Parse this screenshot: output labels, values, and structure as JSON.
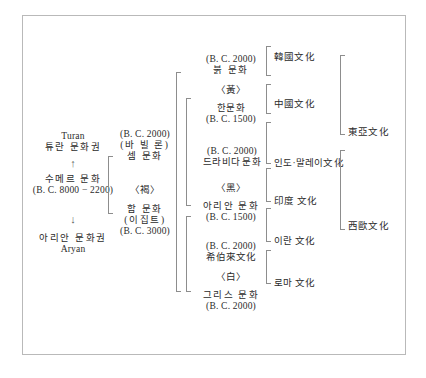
{
  "diagram": {
    "frame_color": "#b9b9b9",
    "text_color": "#2b2b2b",
    "columns": [
      {
        "id": "col1",
        "name": "origin-column",
        "nodes": [
          {
            "id": "turan",
            "lines": [
              "Turan",
              "튜란 문화권"
            ]
          },
          {
            "id": "arrow-up",
            "lines": [
              "↑"
            ]
          },
          {
            "id": "sumer",
            "lines": [
              "수메르 문화",
              "(B. C. 8000 − 2200)"
            ]
          },
          {
            "id": "arrow-down",
            "lines": [
              "↓"
            ]
          },
          {
            "id": "aryan",
            "lines": [
              "아리안 문화권",
              "Aryan"
            ]
          }
        ]
      },
      {
        "id": "col2",
        "name": "semitic-hamitic-column",
        "nodes": [
          {
            "id": "sem",
            "lines": [
              "(B. C. 2000)",
              "(바 빌 론)",
              "셈 문화"
            ]
          },
          {
            "id": "brown",
            "lines": [
              "〈褐〉"
            ]
          },
          {
            "id": "ham",
            "lines": [
              "함 문화",
              "(이집트)",
              "(B. C. 3000)"
            ]
          }
        ]
      },
      {
        "id": "col3",
        "name": "color-branch-column",
        "nodes": [
          {
            "id": "bulk",
            "lines": [
              "(B. C. 2000)",
              "붉 문화"
            ]
          },
          {
            "id": "yellow",
            "lines": [
              "〈黃〉"
            ]
          },
          {
            "id": "han",
            "lines": [
              "한문화",
              "(B. C. 1500)"
            ]
          },
          {
            "id": "dravida",
            "lines": [
              "(B. C. 2000)",
              "드라비다 문화"
            ]
          },
          {
            "id": "black",
            "lines": [
              "〈黑〉"
            ]
          },
          {
            "id": "aryan2",
            "lines": [
              "아리안 문화",
              "(B. C. 1500)"
            ]
          },
          {
            "id": "hebrew",
            "lines": [
              "(B. C. 2000)",
              "希伯來文化"
            ]
          },
          {
            "id": "white",
            "lines": [
              "〈白〉"
            ]
          },
          {
            "id": "greece",
            "lines": [
              "그리스 문화",
              "(B. C. 2000)"
            ]
          }
        ]
      },
      {
        "id": "col4",
        "name": "national-culture-column",
        "nodes": [
          {
            "id": "korea",
            "lines": [
              "韓國文化"
            ]
          },
          {
            "id": "china",
            "lines": [
              "中國文化"
            ]
          },
          {
            "id": "indomalay",
            "lines": [
              "인도·말레이文化"
            ]
          },
          {
            "id": "india",
            "lines": [
              "印度 文化"
            ]
          },
          {
            "id": "iran",
            "lines": [
              "이란 文化"
            ]
          },
          {
            "id": "roma",
            "lines": [
              "로마 文化"
            ]
          }
        ]
      },
      {
        "id": "col5",
        "name": "region-culture-column",
        "nodes": [
          {
            "id": "east-asia",
            "lines": [
              "東亞文化"
            ]
          },
          {
            "id": "west-europe",
            "lines": [
              "西歐文化"
            ]
          }
        ]
      }
    ]
  }
}
